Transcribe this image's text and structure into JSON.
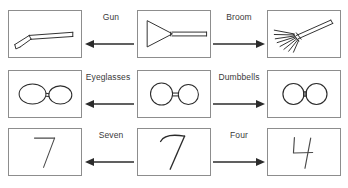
{
  "figure": {
    "type": "diagram",
    "background_color": "#ffffff",
    "frame_border_color": "#8d8d8d",
    "stroke_color": "#2b2b2b",
    "label_color": "#3a3a3a"
  },
  "rows": [
    {
      "id": "row-arrow-shape",
      "center": {
        "name": "arrow-triangle-with-shaft-drawing",
        "icon": "triangle-shaft-icon"
      },
      "left": {
        "label": "Gun",
        "name": "gun-drawing",
        "icon": "gun-icon",
        "arrow_direction": "left"
      },
      "right": {
        "label": "Broom",
        "name": "broom-drawing",
        "icon": "broom-icon",
        "arrow_direction": "right"
      }
    },
    {
      "id": "row-two-circles",
      "center": {
        "name": "two-circles-with-bar-drawing",
        "icon": "two-circles-bar-icon"
      },
      "left": {
        "label": "Eyeglasses",
        "name": "eyeglasses-drawing",
        "icon": "eyeglasses-icon",
        "arrow_direction": "left"
      },
      "right": {
        "label": "Dumbbells",
        "name": "dumbbells-drawing",
        "icon": "dumbbells-icon",
        "arrow_direction": "right"
      }
    },
    {
      "id": "row-seven-four",
      "center": {
        "name": "ambiguous-digit-drawing",
        "icon": "handwritten-seven-icon"
      },
      "left": {
        "label": "Seven",
        "name": "seven-drawing",
        "icon": "digit-seven-icon",
        "arrow_direction": "left"
      },
      "right": {
        "label": "Four",
        "name": "four-drawing",
        "icon": "digit-four-icon",
        "arrow_direction": "right"
      }
    }
  ]
}
